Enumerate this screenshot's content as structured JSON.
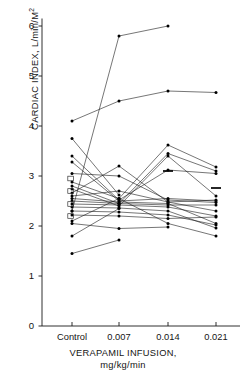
{
  "chart_data": {
    "type": "line",
    "title": "",
    "xlabel": "VERAPAMIL INFUSION, mg/kg/min",
    "xlabel_line1": "VERAPAMIL INFUSION,",
    "xlabel_line2": "mg/kg/min",
    "ylabel": "CARDIAC INDEX, L/min/M2",
    "ylabel_main": "CARDIAC INDEX, L/min/M",
    "ylabel_sup": "2",
    "categories": [
      "Control",
      "0.007",
      "0.014",
      "0.021"
    ],
    "xticklabels": [
      "Control",
      "0.007",
      "0.014",
      "0.021"
    ],
    "yticks": [
      0,
      1,
      2,
      3,
      4,
      5,
      6
    ],
    "yticklabels": [
      "0",
      "1",
      "2",
      "3",
      "4",
      "5",
      "6"
    ],
    "ylim": [
      0,
      6.15
    ],
    "grid": false,
    "legend": false,
    "legend_position": "none",
    "marker": "filled-circle",
    "line_color": "#1a1a1a",
    "marker_color": "#000000",
    "axis_color": "#1a1a1a",
    "background": "#ffffff",
    "series": [
      {
        "name": "subject-1",
        "values": [
          2.3,
          5.8,
          6.0,
          null
        ]
      },
      {
        "name": "subject-2",
        "values": [
          4.1,
          4.5,
          4.7,
          4.67
        ]
      },
      {
        "name": "subject-3",
        "values": [
          3.75,
          2.62,
          null,
          null
        ]
      },
      {
        "name": "subject-4",
        "values": [
          3.4,
          2.52,
          3.12,
          3.05
        ]
      },
      {
        "name": "subject-5",
        "values": [
          3.28,
          2.5,
          2.55,
          2.5
        ]
      },
      {
        "name": "subject-6",
        "values": [
          3.05,
          3.0,
          2.52,
          2.47
        ]
      },
      {
        "name": "subject-7",
        "values": [
          2.88,
          2.55,
          3.62,
          3.18
        ]
      },
      {
        "name": "subject-8",
        "values": [
          2.8,
          2.45,
          3.45,
          3.1
        ]
      },
      {
        "name": "subject-9",
        "values": [
          2.74,
          2.4,
          3.4,
          2.6
        ]
      },
      {
        "name": "subject-10",
        "values": [
          2.66,
          3.2,
          2.48,
          2.52
        ]
      },
      {
        "name": "subject-11",
        "values": [
          2.6,
          2.7,
          2.48,
          2.3
        ]
      },
      {
        "name": "subject-12",
        "values": [
          2.55,
          2.48,
          2.45,
          2.05
        ]
      },
      {
        "name": "subject-13",
        "values": [
          2.5,
          2.45,
          2.42,
          2.42
        ]
      },
      {
        "name": "subject-14",
        "values": [
          2.44,
          2.42,
          2.38,
          2.2
        ]
      },
      {
        "name": "subject-15",
        "values": [
          2.38,
          2.36,
          2.3,
          1.96
        ]
      },
      {
        "name": "subject-16",
        "values": [
          2.3,
          2.28,
          2.22,
          2.02
        ]
      },
      {
        "name": "subject-17",
        "values": [
          2.22,
          2.2,
          2.15,
          2.18
        ]
      },
      {
        "name": "subject-18",
        "values": [
          2.1,
          2.55,
          2.05,
          1.8
        ]
      },
      {
        "name": "subject-19",
        "values": [
          2.05,
          1.95,
          1.98,
          null
        ]
      },
      {
        "name": "subject-20",
        "values": [
          1.8,
          2.35,
          null,
          null
        ]
      },
      {
        "name": "subject-21",
        "values": [
          1.45,
          1.72,
          null,
          null
        ]
      }
    ],
    "mean_markers": [
      {
        "category": "0.014",
        "value": 3.1
      },
      {
        "category": "0.021",
        "value": 2.76
      }
    ],
    "box_markers": [
      {
        "category": "Control",
        "value": 2.95
      },
      {
        "category": "Control",
        "value": 2.7
      },
      {
        "category": "Control",
        "value": 2.44
      },
      {
        "category": "Control",
        "value": 2.2
      }
    ]
  }
}
